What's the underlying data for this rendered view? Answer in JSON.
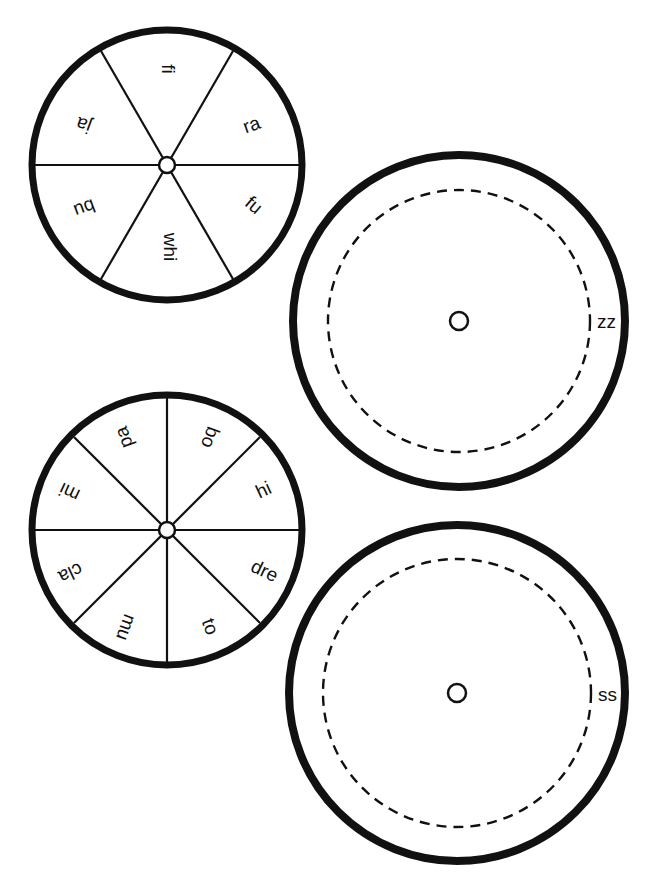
{
  "page": {
    "background": "#ffffff",
    "ink": "#111111"
  },
  "wheels": [
    {
      "id": "wheel-six",
      "segments": 6,
      "labels": [
        "fi",
        "ra",
        "fu",
        "whi",
        "bu",
        "ja"
      ]
    },
    {
      "id": "wheel-eight",
      "segments": 8,
      "labels": [
        "bo",
        "hi",
        "dre",
        "to",
        "mu",
        "cla",
        "mi",
        "pa"
      ]
    }
  ],
  "discs": [
    {
      "id": "disc-zz",
      "ending": "zz"
    },
    {
      "id": "disc-ss",
      "ending": "ss"
    }
  ]
}
